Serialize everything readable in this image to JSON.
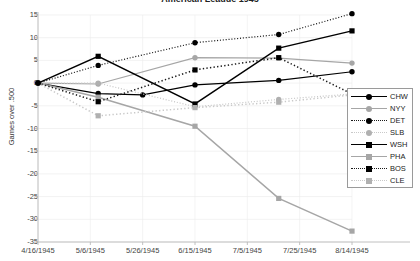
{
  "chart_data": {
    "type": "line",
    "title": "American League 1945",
    "xlabel": "",
    "ylabel": "Games over .500",
    "ylim": [
      -35,
      15
    ],
    "ytick_step": 5,
    "yticks": [
      15,
      10,
      5,
      0,
      -5,
      -10,
      -15,
      -20,
      -25,
      -30,
      -35
    ],
    "grid": false,
    "legend_position": "right-inside",
    "categories": [
      "4/16/1945",
      "5/6/1945",
      "5/26/1945",
      "6/15/1945",
      "7/5/1945",
      "7/25/1945",
      "8/14/1945"
    ],
    "x_index": [
      0,
      1,
      2,
      3,
      4,
      5,
      6
    ],
    "series": [
      {
        "name": "CHW",
        "color": "#000000",
        "dash": "solid",
        "marker": "circle",
        "marker_color": "#000000",
        "values": [
          0,
          -2.3,
          -2.6,
          -0.4,
          null,
          0.6,
          2.5
        ],
        "points": [
          {
            "x": 0.0,
            "y": 0
          },
          {
            "x": 1.15,
            "y": -2.3
          },
          {
            "x": 2.0,
            "y": -2.6
          },
          {
            "x": 3.0,
            "y": -0.4
          },
          {
            "x": 4.6,
            "y": 0.6
          },
          {
            "x": 6.0,
            "y": 2.5
          }
        ]
      },
      {
        "name": "NYY",
        "color": "#a6a6a6",
        "dash": "solid",
        "marker": "circle",
        "marker_color": "#a6a6a6",
        "values": [
          0,
          -0.2,
          null,
          5.6,
          null,
          5.5,
          4.4
        ],
        "points": [
          {
            "x": 0.0,
            "y": 0
          },
          {
            "x": 1.15,
            "y": -0.2
          },
          {
            "x": 3.0,
            "y": 5.6
          },
          {
            "x": 4.6,
            "y": 5.5
          },
          {
            "x": 6.0,
            "y": 4.4
          }
        ]
      },
      {
        "name": "DET",
        "color": "#1a1a1a",
        "dash": "dotted",
        "marker": "circle",
        "marker_color": "#000000",
        "values": [
          0,
          3.9,
          null,
          8.9,
          null,
          10.7,
          15.3
        ],
        "points": [
          {
            "x": 0.0,
            "y": 0
          },
          {
            "x": 1.15,
            "y": 3.9
          },
          {
            "x": 3.0,
            "y": 8.9
          },
          {
            "x": 4.6,
            "y": 10.7
          },
          {
            "x": 6.0,
            "y": 15.3
          }
        ]
      },
      {
        "name": "SLB",
        "color": "#c9c9c9",
        "dash": "dotted",
        "marker": "circle",
        "marker_color": "#b0b0b0",
        "values": [
          0,
          0.0,
          null,
          -5.2,
          null,
          -3.6,
          -2.4
        ],
        "points": [
          {
            "x": 0.0,
            "y": 0
          },
          {
            "x": 1.15,
            "y": 0.0
          },
          {
            "x": 3.0,
            "y": -5.2
          },
          {
            "x": 4.6,
            "y": -3.6
          },
          {
            "x": 6.0,
            "y": -2.4
          }
        ]
      },
      {
        "name": "WSH",
        "color": "#000000",
        "dash": "solid",
        "marker": "square",
        "marker_color": "#000000",
        "values": [
          0,
          5.9,
          null,
          -4.6,
          null,
          7.7,
          11.5
        ],
        "points": [
          {
            "x": 0.0,
            "y": 0
          },
          {
            "x": 1.15,
            "y": 5.9
          },
          {
            "x": 3.0,
            "y": -4.6
          },
          {
            "x": 4.6,
            "y": 7.7
          },
          {
            "x": 6.0,
            "y": 11.5
          }
        ]
      },
      {
        "name": "PHA",
        "color": "#a6a6a6",
        "dash": "solid",
        "marker": "square",
        "marker_color": "#a6a6a6",
        "values": [
          0,
          -3.1,
          null,
          -9.5,
          null,
          -25.4,
          -32.6
        ],
        "points": [
          {
            "x": 0.0,
            "y": 0
          },
          {
            "x": 1.15,
            "y": -3.1
          },
          {
            "x": 3.0,
            "y": -9.5
          },
          {
            "x": 4.6,
            "y": -25.4
          },
          {
            "x": 6.0,
            "y": -32.6
          }
        ]
      },
      {
        "name": "BOS",
        "color": "#1a1a1a",
        "dash": "dotted",
        "marker": "square",
        "marker_color": "#000000",
        "values": [
          0,
          -4.1,
          null,
          2.9,
          null,
          5.6,
          2.5
        ],
        "points": [
          {
            "x": 0.0,
            "y": 0
          },
          {
            "x": 1.15,
            "y": -4.1
          },
          {
            "x": 3.0,
            "y": 2.9
          },
          {
            "x": 4.6,
            "y": 5.6
          },
          {
            "x": 6.0,
            "y": -2.4
          }
        ]
      },
      {
        "name": "CLE",
        "color": "#c9c9c9",
        "dash": "dotted",
        "marker": "square",
        "marker_color": "#b0b0b0",
        "values": [
          0,
          -7.2,
          null,
          -5.4,
          null,
          -4.2,
          -2.6
        ],
        "points": [
          {
            "x": 0.0,
            "y": 0
          },
          {
            "x": 1.15,
            "y": -7.2
          },
          {
            "x": 3.0,
            "y": -5.4
          },
          {
            "x": 4.6,
            "y": -4.2
          },
          {
            "x": 6.0,
            "y": -2.6
          }
        ]
      }
    ]
  },
  "legend": {
    "entries": [
      {
        "label": "CHW"
      },
      {
        "label": "NYY"
      },
      {
        "label": "DET"
      },
      {
        "label": "SLB"
      },
      {
        "label": "WSH"
      },
      {
        "label": "PHA"
      },
      {
        "label": "BOS"
      },
      {
        "label": "CLE"
      }
    ]
  }
}
